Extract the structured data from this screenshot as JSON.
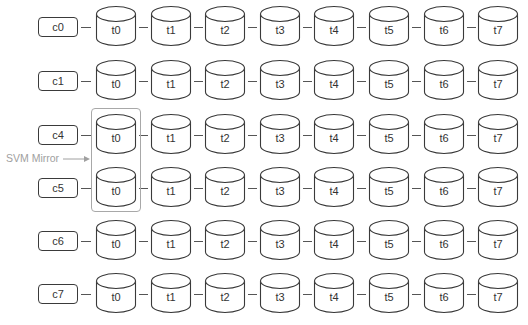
{
  "diagram": {
    "type": "client-to-tier-chains",
    "colors": {
      "stroke": "#3a3a3a",
      "text": "#333333",
      "mirror": "#a8a8a8",
      "background": "#ffffff"
    },
    "tiers": [
      "t0",
      "t1",
      "t2",
      "t3",
      "t4",
      "t5",
      "t6",
      "t7"
    ],
    "rows": [
      {
        "client": "c0"
      },
      {
        "client": "c1"
      },
      {
        "client": "c4"
      },
      {
        "client": "c5"
      },
      {
        "client": "c6"
      },
      {
        "client": "c7"
      }
    ],
    "annotation": {
      "label": "SVM Mirror",
      "target_tier": "t0",
      "target_rows": [
        "c4",
        "c5"
      ],
      "icon": "arrow-right-icon"
    }
  }
}
